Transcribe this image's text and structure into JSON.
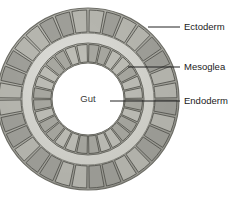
{
  "figure": {
    "title_visible": false,
    "background_color": "#ffffff",
    "type": "labeled-anatomical-cross-section"
  },
  "geometry": {
    "center_x": 88,
    "center_y": 99,
    "outer_radius": 91,
    "ectoderm_inner_radius": 66,
    "mesoglea_outer_radius": 66,
    "mesoglea_inner_radius": 56,
    "endoderm_outer_radius": 56,
    "endoderm_inner_radius": 36,
    "gut_radius": 36,
    "ectoderm_cell_count": 32,
    "endoderm_cell_count": 28
  },
  "colors": {
    "ectoderm_fill": "#9a9a94",
    "ectoderm_fill_light": "#b5b5ae",
    "ectoderm_stroke": "#55554f",
    "mesoglea_fill": "#d2d2cb",
    "mesoglea_stroke": "#8d8d86",
    "endoderm_fill": "#a3a39c",
    "endoderm_fill_light": "#bcbcb5",
    "endoderm_stroke": "#56564f",
    "gut_fill": "#ffffff",
    "outer_rim_stroke": "#6e6e67",
    "label_text": "#1a1a1a",
    "leader_line": "#222222"
  },
  "labels": {
    "ectoderm": {
      "text": "Ectoderm",
      "text_x": 184,
      "text_y": 27,
      "leader_from_x": 148,
      "leader_from_y": 27,
      "leader_to_x": 180,
      "leader_to_y": 27
    },
    "mesoglea": {
      "text": "Mesoglea",
      "text_x": 184,
      "text_y": 67,
      "leader_from_x": 128,
      "leader_from_y": 67,
      "leader_to_x": 180,
      "leader_to_y": 67
    },
    "endoderm": {
      "text": "Endoderm",
      "text_x": 184,
      "text_y": 101,
      "leader_from_x": 110,
      "leader_from_y": 101,
      "leader_to_x": 180,
      "leader_to_y": 101
    },
    "gut": {
      "text": "Gut",
      "text_x": 88,
      "text_y": 99
    }
  }
}
